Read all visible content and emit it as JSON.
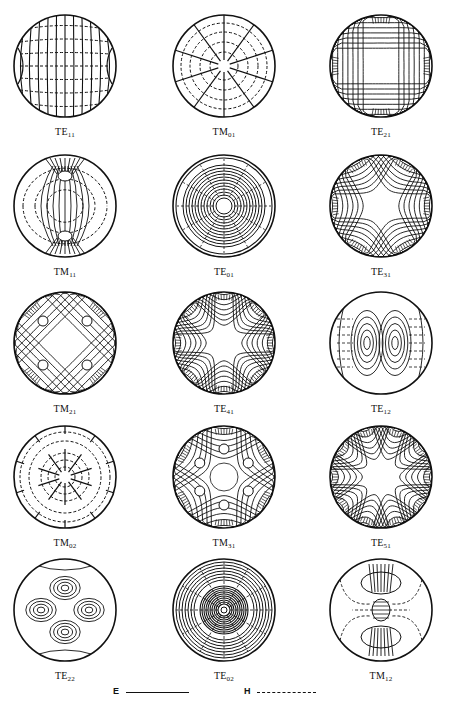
{
  "figure": {
    "type": "circular-waveguide-mode-field-patterns",
    "grid": {
      "rows": 5,
      "cols": 3
    },
    "line_color": "#111111",
    "background": "#ffffff"
  },
  "modes": [
    {
      "row": 0,
      "col": 0,
      "base": "TE",
      "sub": "11",
      "pattern": "te11"
    },
    {
      "row": 0,
      "col": 1,
      "base": "TM",
      "sub": "01",
      "pattern": "tm01"
    },
    {
      "row": 0,
      "col": 2,
      "base": "TE",
      "sub": "21",
      "pattern": "te21"
    },
    {
      "row": 1,
      "col": 0,
      "base": "TM",
      "sub": "11",
      "pattern": "tm11"
    },
    {
      "row": 1,
      "col": 1,
      "base": "TE",
      "sub": "01",
      "pattern": "te01"
    },
    {
      "row": 1,
      "col": 2,
      "base": "TE",
      "sub": "31",
      "pattern": "te31"
    },
    {
      "row": 2,
      "col": 0,
      "base": "TM",
      "sub": "21",
      "pattern": "tm21"
    },
    {
      "row": 2,
      "col": 1,
      "base": "TE",
      "sub": "41",
      "pattern": "te41"
    },
    {
      "row": 2,
      "col": 2,
      "base": "TE",
      "sub": "12",
      "pattern": "te12"
    },
    {
      "row": 3,
      "col": 0,
      "base": "TM",
      "sub": "02",
      "pattern": "tm02"
    },
    {
      "row": 3,
      "col": 1,
      "base": "TM",
      "sub": "31",
      "pattern": "tm31"
    },
    {
      "row": 3,
      "col": 2,
      "base": "TE",
      "sub": "51",
      "pattern": "te51"
    },
    {
      "row": 4,
      "col": 0,
      "base": "TE",
      "sub": "22",
      "pattern": "te22"
    },
    {
      "row": 4,
      "col": 1,
      "base": "TE",
      "sub": "02",
      "pattern": "te02"
    },
    {
      "row": 4,
      "col": 2,
      "base": "TM",
      "sub": "12",
      "pattern": "tm12"
    }
  ],
  "legend": {
    "e_label": "E",
    "e_style": "solid",
    "h_label": "H",
    "h_style": "dashed"
  }
}
